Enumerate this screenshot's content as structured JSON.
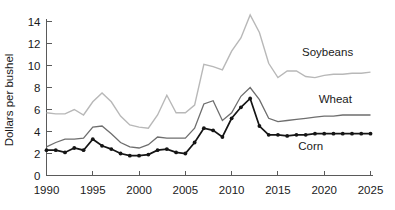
{
  "chart_data": {
    "type": "line",
    "title": "",
    "subtitle": "",
    "xlabel": "",
    "ylabel": "Dollars per bushel",
    "xlim": [
      1990,
      2025
    ],
    "ylim": [
      0,
      15
    ],
    "grid": false,
    "legend_position": "inline-annotation",
    "x_ticks": [
      "1990",
      "1995",
      "2000",
      "2005",
      "2010",
      "2015",
      "2020",
      "2025"
    ],
    "x_tick_values": [
      1990,
      1995,
      2000,
      2005,
      2010,
      2015,
      2020,
      2025
    ],
    "y_ticks": [
      "0",
      "2",
      "4",
      "6",
      "8",
      "10",
      "12",
      "14"
    ],
    "y_tick_values": [
      0,
      2,
      4,
      6,
      8,
      10,
      12,
      14
    ],
    "x": [
      1990,
      1991,
      1992,
      1993,
      1994,
      1995,
      1996,
      1997,
      1998,
      1999,
      2000,
      2001,
      2002,
      2003,
      2004,
      2005,
      2006,
      2007,
      2008,
      2009,
      2010,
      2011,
      2012,
      2013,
      2014,
      2015,
      2016,
      2017,
      2018,
      2019,
      2020,
      2021,
      2022,
      2023,
      2024,
      2025
    ],
    "series": [
      {
        "name": "Soybeans",
        "color": "#b8b8b8",
        "width": 1.4,
        "markers": false,
        "annotation": "Soybeans",
        "values": [
          5.7,
          5.6,
          5.6,
          6.0,
          5.5,
          6.7,
          7.5,
          6.7,
          5.4,
          4.6,
          4.4,
          4.3,
          5.5,
          7.3,
          5.7,
          5.7,
          6.4,
          10.1,
          9.9,
          9.6,
          11.3,
          12.5,
          14.6,
          13.0,
          10.2,
          8.9,
          9.5,
          9.5,
          9.0,
          8.9,
          9.1,
          9.2,
          9.2,
          9.3,
          9.3,
          9.4
        ]
      },
      {
        "name": "Wheat",
        "color": "#6e6e6e",
        "width": 1.3,
        "markers": false,
        "annotation": "Wheat",
        "values": [
          2.6,
          3.0,
          3.3,
          3.3,
          3.4,
          4.4,
          4.5,
          3.8,
          3.0,
          2.6,
          2.5,
          2.8,
          3.5,
          3.4,
          3.4,
          3.4,
          4.3,
          6.5,
          6.8,
          5.0,
          5.7,
          7.2,
          8.0,
          6.9,
          5.2,
          4.9,
          5.0,
          5.1,
          5.2,
          5.3,
          5.4,
          5.4,
          5.5,
          5.5,
          5.5,
          5.5
        ]
      },
      {
        "name": "Corn",
        "color": "#151515",
        "width": 1.7,
        "markers": true,
        "annotation": "Corn",
        "values": [
          2.3,
          2.3,
          2.1,
          2.5,
          2.3,
          3.3,
          2.7,
          2.4,
          2.0,
          1.8,
          1.8,
          1.9,
          2.3,
          2.4,
          2.1,
          2.0,
          3.0,
          4.3,
          4.1,
          3.5,
          5.2,
          6.2,
          7.0,
          4.5,
          3.7,
          3.7,
          3.6,
          3.7,
          3.7,
          3.8,
          3.8,
          3.8,
          3.8,
          3.8,
          3.8,
          3.8
        ]
      }
    ],
    "annotations": [
      {
        "text": "Soybeans",
        "x": 2017.6,
        "y": 10.9
      },
      {
        "text": "Wheat",
        "x": 2019.4,
        "y": 6.6
      },
      {
        "text": "Corn",
        "x": 2017.2,
        "y": 2.35
      }
    ]
  },
  "axis": {
    "ylabel": "Dollars per bushel"
  }
}
